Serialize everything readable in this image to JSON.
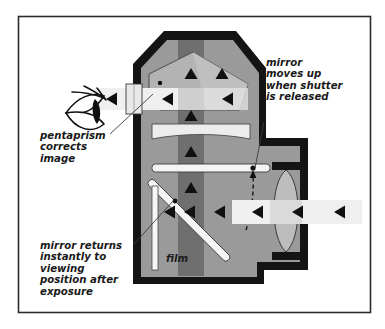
{
  "figure": {
    "frame": {
      "border_color": "#2b2b2b",
      "background_color": "#ffffff"
    }
  },
  "palette": {
    "body_fill": "#9a9a9a",
    "body_outline": "#111111",
    "beam_light": "#efefef",
    "beam_dark_band": "#6f6f6f",
    "beam_overlap": "#cfcfcf",
    "prism_fill": "#b3b3b3",
    "lens_fill": "#bdbdbd",
    "mirror_fill": "#f4f4f4",
    "film_fill": "#f7f7f7",
    "arrow_color": "#101010",
    "leader_color": "#3a3a3a",
    "text_color": "#1a1a1a"
  },
  "labels": [
    {
      "id": "pentaprism-label",
      "name": "pentaprism-corrects-image-label",
      "lines": [
        "pentaprism",
        "corrects",
        "image"
      ],
      "x": 40,
      "y": 139
    },
    {
      "id": "mirror-up-label",
      "name": "mirror-moves-up-label",
      "lines": [
        "mirror",
        "moves up",
        "when shutter",
        "is released"
      ],
      "x": 266,
      "y": 66
    },
    {
      "id": "mirror-returns-label",
      "name": "mirror-returns-label",
      "lines": [
        "mirror returns",
        "instantly to",
        "viewing",
        "position after",
        "exposure"
      ],
      "x": 40,
      "y": 249
    },
    {
      "id": "film-label",
      "name": "film-label",
      "lines": [
        "film"
      ],
      "x": 166,
      "y": 262
    }
  ],
  "components": {
    "eye": "viewer-eye",
    "eyepiece": "eyepiece-viewfinder",
    "pentaprism": "pentaprism-block",
    "focusing_screen": "focusing-screen",
    "mirror_up": "mirror-up-position",
    "mirror_down": "mirror-down-position",
    "film": "film-plane",
    "lens": "objective-lens",
    "body": "camera-body-shell",
    "motion_arc": "mirror-motion-arc",
    "pivot": "mirror-pivot-point"
  },
  "light_path": {
    "description": "Light enters from right through lens, reflects off mirror up through focusing screen and pentaprism, exits left to eye",
    "entering_arrows_count": 4,
    "vertical_arrows_count": 5,
    "eyepiece_arrows_count": 1
  }
}
